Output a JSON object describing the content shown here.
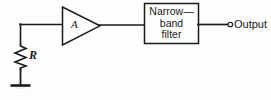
{
  "figure": {
    "kind": "circuit-schematic",
    "background_color": "#fdfdfd",
    "line_color": "#1a1a1a",
    "text_color": "#1a1a1a"
  },
  "components": {
    "resistor": {
      "label": "R",
      "name": "resistor-R"
    },
    "ground": {
      "name": "ground-symbol"
    },
    "amplifier": {
      "label": "A",
      "name": "amplifier-triangle"
    },
    "filter": {
      "line1": "Narrow—",
      "line2": "band",
      "line3": "filter",
      "name": "narrow-band-filter-block"
    },
    "output": {
      "label": "Output",
      "terminal": "open-circle"
    }
  }
}
